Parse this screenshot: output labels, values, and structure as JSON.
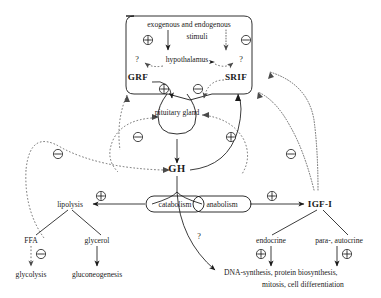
{
  "diagram": {
    "type": "biological-pathway-flowchart",
    "canvas": {
      "width": 381,
      "height": 298
    },
    "colors": {
      "ink": "#1a1a1a",
      "dashed_ink": "#4a4a4a",
      "background": "#ffffff"
    },
    "nodes": {
      "stimuli": "exogenous and endogenous",
      "stimuli_line2": "stimuli",
      "hypothalamus": "hypothalamus",
      "grf": "GRF",
      "srif": "SRIF",
      "pituitary": "pituitary gland",
      "gh": "GH",
      "lipolysis": "lipolysis",
      "catabolism": "catabolism",
      "anabolism": "anabolism",
      "igf1": "IGF-I",
      "ffa": "FFA",
      "glycerol": "glycerol",
      "glycolysis": "glycolysis",
      "gluconeogenesis": "gluconeogenesis",
      "endocrine": "endocrine",
      "para_autocrine": "para-, autocrine",
      "effects_line1": "DNA-synthesis, protein biosynthesis,",
      "effects_line2": "mitosis, cell differentiation"
    },
    "signs": {
      "plus": "⊕",
      "minus": "⊖",
      "question": "?"
    },
    "annotations": {
      "q_left_hypothalamus": "?",
      "q_right_hypothalamus": "?",
      "q_gh_to_effects": "?"
    },
    "sign_markers": [
      {
        "id": "stimuli-plus",
        "sign": "plus",
        "x": 148,
        "y": 40,
        "note": "stimulatory input to hypothalamus"
      },
      {
        "id": "stimuli-minus",
        "sign": "minus",
        "x": 246,
        "y": 40,
        "note": "inhibitory input to hypothalamus"
      },
      {
        "id": "grf-plus",
        "sign": "plus",
        "x": 164,
        "y": 89,
        "note": "GRF stimulates pituitary"
      },
      {
        "id": "srif-minus",
        "sign": "minus",
        "x": 198,
        "y": 89,
        "note": "SRIF inhibits pituitary"
      },
      {
        "id": "short-loop-minus",
        "sign": "minus",
        "x": 138,
        "y": 137,
        "note": "short-loop negative feedback"
      },
      {
        "id": "short-loop-plus",
        "sign": "plus",
        "x": 231,
        "y": 137,
        "note": "short-loop positive feedback"
      },
      {
        "id": "long-loop-minus-l",
        "sign": "minus",
        "x": 58,
        "y": 154,
        "note": "long-loop negative feedback left"
      },
      {
        "id": "long-loop-minus-r",
        "sign": "minus",
        "x": 291,
        "y": 154,
        "note": "long-loop negative feedback right"
      },
      {
        "id": "lipolysis-plus",
        "sign": "plus",
        "x": 101,
        "y": 203,
        "note": "catabolism stimulates lipolysis"
      },
      {
        "id": "igf1-plus",
        "sign": "plus",
        "x": 272,
        "y": 203,
        "note": "anabolism stimulates IGF-I"
      },
      {
        "id": "glycolysis-minus",
        "sign": "minus",
        "x": 39,
        "y": 254,
        "note": "FFA inhibits glycolysis"
      },
      {
        "id": "endocrine-plus",
        "sign": "plus",
        "x": 261,
        "y": 254,
        "note": "endocrine IGF-I stimulates effects"
      },
      {
        "id": "autocrine-plus",
        "sign": "plus",
        "x": 341,
        "y": 254,
        "note": "para-/autocrine IGF-I stimulates effects"
      }
    ],
    "edges": [
      {
        "from": "stimuli",
        "to": "hypothalamus",
        "style": "solid",
        "sign": "plus"
      },
      {
        "from": "stimuli",
        "to": "hypothalamus",
        "style": "dotted",
        "sign": "minus"
      },
      {
        "from": "hypothalamus",
        "to": "grf",
        "style": "dashed",
        "sign": "question"
      },
      {
        "from": "hypothalamus",
        "to": "srif",
        "style": "dashed",
        "sign": "question"
      },
      {
        "from": "grf",
        "to": "pituitary",
        "style": "solid",
        "sign": "plus"
      },
      {
        "from": "srif",
        "to": "pituitary",
        "style": "dashed",
        "sign": "minus"
      },
      {
        "from": "pituitary",
        "to": "gh",
        "style": "solid",
        "sign": null
      },
      {
        "from": "gh",
        "to": "catabolism",
        "style": "solid",
        "sign": null
      },
      {
        "from": "gh",
        "to": "anabolism",
        "style": "solid",
        "sign": null
      },
      {
        "from": "catabolism",
        "to": "lipolysis",
        "style": "solid",
        "sign": "plus"
      },
      {
        "from": "anabolism",
        "to": "igf1",
        "style": "solid",
        "sign": "plus"
      },
      {
        "from": "lipolysis",
        "to": "ffa",
        "style": "solid",
        "sign": null
      },
      {
        "from": "lipolysis",
        "to": "glycerol",
        "style": "solid",
        "sign": null
      },
      {
        "from": "ffa",
        "to": "glycolysis",
        "style": "dashed",
        "sign": "minus"
      },
      {
        "from": "glycerol",
        "to": "gluconeogenesis",
        "style": "solid",
        "sign": null
      },
      {
        "from": "igf1",
        "to": "endocrine",
        "style": "solid",
        "sign": null
      },
      {
        "from": "igf1",
        "to": "para_autocrine",
        "style": "solid",
        "sign": null
      },
      {
        "from": "endocrine",
        "to": "effects",
        "style": "solid",
        "sign": "plus"
      },
      {
        "from": "para_autocrine",
        "to": "effects",
        "style": "solid",
        "sign": "plus"
      },
      {
        "from": "gh",
        "to": "effects",
        "style": "solid",
        "sign": "question"
      },
      {
        "from": "igf1",
        "to": "pituitary",
        "style": "dotted",
        "sign": "minus"
      },
      {
        "from": "igf1",
        "to": "hypothalamus",
        "style": "dotted",
        "sign": "minus"
      },
      {
        "from": "gh",
        "to": "pituitary",
        "style": "dashed",
        "sign": "minus"
      },
      {
        "from": "gh",
        "to": "hypothalamus",
        "style": "dashed",
        "sign": "minus"
      },
      {
        "from": "gh",
        "to": "srif",
        "style": "solid",
        "sign": "plus"
      }
    ]
  }
}
